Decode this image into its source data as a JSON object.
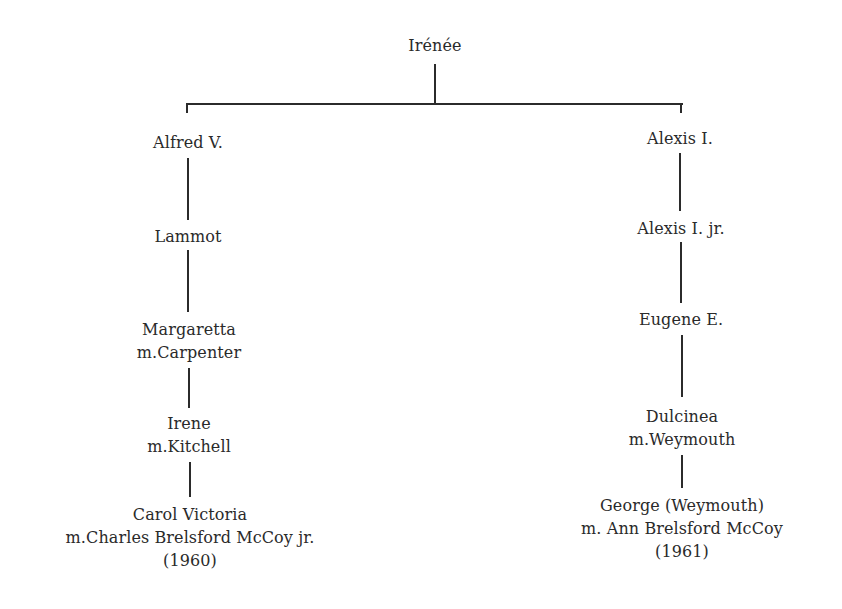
{
  "diagram": {
    "type": "family-tree",
    "root": {
      "name": "Irénée"
    },
    "branches": [
      {
        "side": "left",
        "generations": [
          {
            "lines": [
              "Alfred V."
            ]
          },
          {
            "lines": [
              "Lammot"
            ]
          },
          {
            "lines": [
              "Margaretta",
              "m.Carpenter"
            ]
          },
          {
            "lines": [
              "Irene",
              "m.Kitchell"
            ]
          },
          {
            "lines": [
              "Carol Victoria",
              "m.Charles Brelsford McCoy jr.",
              "(1960)"
            ]
          }
        ]
      },
      {
        "side": "right",
        "generations": [
          {
            "lines": [
              "Alexis I."
            ]
          },
          {
            "lines": [
              "Alexis I. jr."
            ]
          },
          {
            "lines": [
              "Eugene E."
            ]
          },
          {
            "lines": [
              "Dulcinea",
              "m.Weymouth"
            ]
          },
          {
            "lines": [
              "George (Weymouth)",
              "m. Ann Brelsford McCoy",
              "(1961)"
            ]
          }
        ]
      }
    ],
    "line_color": "#2b2b2b",
    "text_color": "#2a2a2a"
  }
}
